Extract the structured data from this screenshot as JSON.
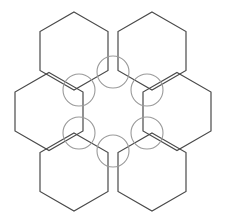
{
  "figure": {
    "width": 225,
    "height": 223,
    "background_color": "#ffffff"
  },
  "style": {
    "hex_stroke_color": "#4a4a4a",
    "hex_stroke_width": 1.2,
    "hex_fill": "none",
    "circle_stroke_color": "#9a9a9a",
    "circle_stroke_width": 1.1,
    "circle_fill": "none"
  },
  "geometry": {
    "orientation": "flat-top",
    "hex_radius": 39,
    "hex_width": 78,
    "hex_height": 67.5,
    "circle_radius": 16,
    "lattice_center": {
      "x": 113,
      "y": 111.5
    },
    "bounds": {
      "x_min": 15,
      "x_max": 210,
      "y_min": 12,
      "y_max": 211
    }
  },
  "hexagons": [
    {
      "id": "hex-top-left",
      "label": "Top left hexagon",
      "center": {
        "x": 74,
        "y": 51
      },
      "points": "74,12 108,31.5 108,70.5 74,90 40,70.5 40,31.5"
    },
    {
      "id": "hex-top-right",
      "label": "Top right hexagon",
      "center": {
        "x": 152,
        "y": 51
      },
      "points": "152,12 186,31.5 186,70.5 152,90 118,70.5 118,31.5"
    },
    {
      "id": "hex-middle-left",
      "label": "Middle left hexagon",
      "center": {
        "x": 49,
        "y": 111.5
      },
      "points": "49,72.5 83,92 83,131 49,150.5 15,131 15,92"
    },
    {
      "id": "hex-middle-right",
      "label": "Middle right hexagon",
      "center": {
        "x": 177,
        "y": 111.5
      },
      "points": "177,72.5 211,92 211,131 177,150.5 143,131 143,92"
    },
    {
      "id": "hex-bottom-left",
      "label": "Bottom left hexagon",
      "center": {
        "x": 74,
        "y": 172
      },
      "points": "74,133 108,152.5 108,191.5 74,211 40,191.5 40,152.5"
    },
    {
      "id": "hex-bottom-right",
      "label": "Bottom right hexagon",
      "center": {
        "x": 152,
        "y": 172
      },
      "points": "152,133 186,152.5 186,191.5 152,211 118,191.5 118,152.5"
    }
  ],
  "vertex_circles": [
    {
      "id": "circle-top",
      "label": "Top vertex marker",
      "cx": 113,
      "cy": 72,
      "r": 16
    },
    {
      "id": "circle-upper-left",
      "label": "Upper left vertex marker",
      "cx": 79,
      "cy": 90,
      "r": 16
    },
    {
      "id": "circle-upper-right",
      "label": "Upper right vertex marker",
      "cx": 147,
      "cy": 90,
      "r": 16
    },
    {
      "id": "circle-lower-left",
      "label": "Lower left vertex marker",
      "cx": 79,
      "cy": 133,
      "r": 16
    },
    {
      "id": "circle-lower-right",
      "label": "Lower right vertex marker",
      "cx": 147,
      "cy": 133,
      "r": 16
    },
    {
      "id": "circle-bottom",
      "label": "Bottom vertex marker",
      "cx": 113,
      "cy": 151,
      "r": 16
    }
  ]
}
